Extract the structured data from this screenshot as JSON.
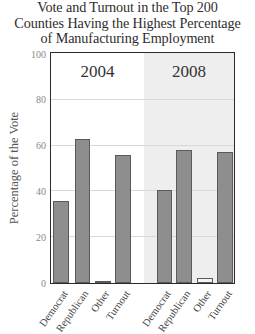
{
  "title": {
    "line1": "Vote and Turnout in the Top 200",
    "line2": "Counties Having the Highest Percentage",
    "line3": "of Manufacturing Employment"
  },
  "panels": [
    {
      "label": "2004",
      "background": "#ffffff"
    },
    {
      "label": "2008",
      "background": "#eeeeee"
    }
  ],
  "axis": {
    "ylabel": "Percentage of the Vote",
    "yticks": [
      "0",
      "20",
      "40",
      "60",
      "80",
      "100"
    ]
  },
  "colors": {
    "bar": "#8e8e8e",
    "bar_outline": "#5a5a5a",
    "panel_2008": "#eeeeee",
    "grid": "#d8d8d8"
  },
  "chart_data": {
    "type": "bar",
    "title": "Vote and Turnout in the Top 200 Counties Having the Highest Percentage of Manufacturing Employment",
    "xlabel": "",
    "ylabel": "Percentage of the Vote",
    "ylim": [
      0,
      100
    ],
    "yticks": [
      0,
      20,
      40,
      60,
      80,
      100
    ],
    "grid": true,
    "legend": "none",
    "categories": [
      "Democrat",
      "Republican",
      "Other",
      "Turnout"
    ],
    "series": [
      {
        "name": "2004",
        "values": [
          36,
          63,
          1,
          56
        ]
      },
      {
        "name": "2008",
        "values": [
          40.5,
          58,
          2,
          57
        ]
      }
    ]
  }
}
